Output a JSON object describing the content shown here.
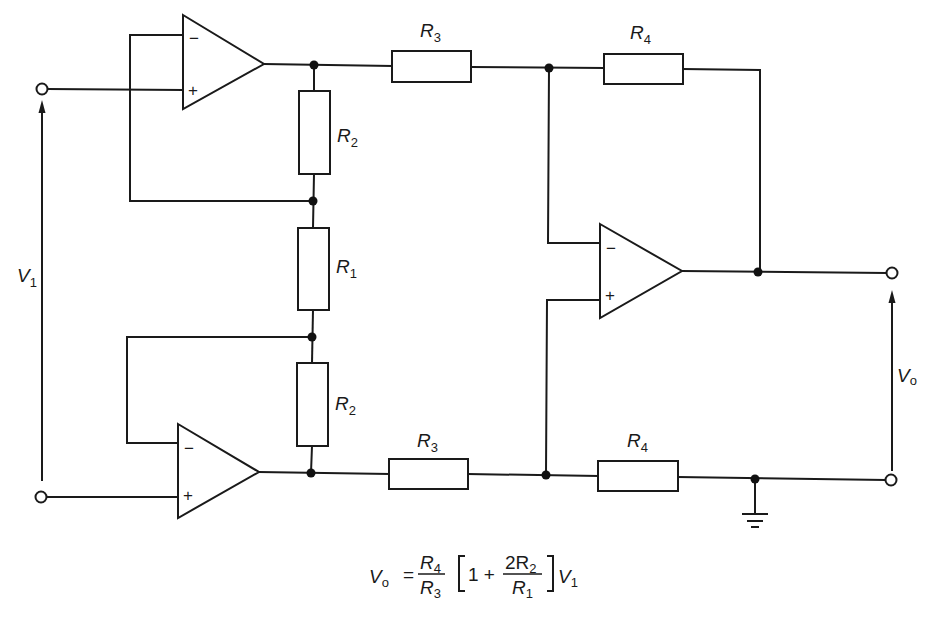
{
  "diagram": {
    "type": "circuit-schematic",
    "components": {
      "resistors": [
        {
          "id": "R2_top",
          "label": "R",
          "sub": "2"
        },
        {
          "id": "R1",
          "label": "R",
          "sub": "1"
        },
        {
          "id": "R2_bottom",
          "label": "R",
          "sub": "2"
        },
        {
          "id": "R3_top",
          "label": "R",
          "sub": "3"
        },
        {
          "id": "R3_bottom",
          "label": "R",
          "sub": "3"
        },
        {
          "id": "R4_top",
          "label": "R",
          "sub": "4"
        },
        {
          "id": "R4_bottom",
          "label": "R",
          "sub": "4"
        }
      ],
      "opamps": [
        {
          "id": "opamp_top",
          "minus": "−",
          "plus": "+"
        },
        {
          "id": "opamp_bottom",
          "minus": "−",
          "plus": "+"
        },
        {
          "id": "opamp_diff",
          "minus": "−",
          "plus": "+"
        }
      ]
    },
    "input_voltage": {
      "label": "V",
      "sub": "1"
    },
    "output_voltage": {
      "label": "V",
      "sub": "o"
    },
    "ground": "ground-symbol",
    "equation": {
      "lhs_var": "V",
      "lhs_sub": "o",
      "equals": "=",
      "frac1_num": "R",
      "frac1_num_sub": "4",
      "frac1_den": "R",
      "frac1_den_sub": "3",
      "bracket_open": "[",
      "one_plus": "1 +",
      "frac2_num": "2R",
      "frac2_num_sub": "2",
      "frac2_den": "R",
      "frac2_den_sub": "1",
      "bracket_close": "]",
      "rhs_var": "V",
      "rhs_sub": "1"
    },
    "colors": {
      "ink": "#1a1a1a",
      "background": "#ffffff"
    }
  }
}
